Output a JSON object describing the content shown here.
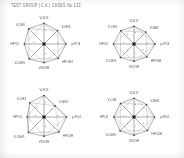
{
  "document": {
    "kind": "scanned-figure-sheet",
    "caption": "TEST GROUP (C.A.) CASES  No  133",
    "background_color": "#fdfdfc",
    "ink_color": "#3b3b3b"
  },
  "chart_data": [
    {
      "id": "panel-top-left",
      "type": "radar",
      "title": "",
      "grid": true,
      "legend_position": "none",
      "categories": [
        "V-SO2",
        "V-NH2",
        "p-PO4",
        "HPO4H",
        "VSO3H",
        "V-C6H5",
        "HPO4",
        "V-CH3"
      ],
      "angles_deg": [
        90,
        45,
        0,
        -45,
        -90,
        -135,
        180,
        135
      ],
      "rlim": [
        0,
        1
      ],
      "series": [
        {
          "name": "case-133-a",
          "values": [
            0.86,
            0.8,
            0.92,
            0.84,
            0.78,
            0.88,
            0.82,
            0.9
          ]
        }
      ],
      "edge_labels": [
        "4",
        "3",
        "6",
        "2",
        "5",
        "2",
        "3",
        "4"
      ]
    },
    {
      "id": "panel-top-right",
      "type": "radar",
      "title": "",
      "grid": true,
      "legend_position": "none",
      "categories": [
        "V-SO2",
        "V-NH2",
        "p-PO4",
        "HPO4H",
        "VSO3H",
        "V-C6H5",
        "HPO4",
        "V-CH3"
      ],
      "angles_deg": [
        90,
        45,
        0,
        -45,
        -90,
        -135,
        180,
        135
      ],
      "rlim": [
        0,
        1
      ],
      "series": [
        {
          "name": "case-133-b",
          "values": [
            0.74,
            0.7,
            0.88,
            0.76,
            0.72,
            0.8,
            0.86,
            0.78
          ]
        }
      ],
      "edge_labels": [
        "3",
        "4",
        "5",
        "3",
        "4",
        "2",
        "6",
        "3"
      ]
    },
    {
      "id": "panel-bottom-left",
      "type": "radar",
      "title": "",
      "grid": true,
      "legend_position": "none",
      "categories": [
        "V-SO2",
        "V-NH2",
        "p-PO4",
        "HPO4H",
        "VSO3H",
        "V-C6H5",
        "HPO4",
        "V-CH3"
      ],
      "angles_deg": [
        90,
        45,
        0,
        -45,
        -90,
        -135,
        180,
        135
      ],
      "rlim": [
        0,
        1
      ],
      "series": [
        {
          "name": "case-133-c",
          "values": [
            0.9,
            0.66,
            0.94,
            0.88,
            0.8,
            0.92,
            0.7,
            0.84
          ]
        }
      ],
      "edge_labels": [
        "5",
        "2",
        "6",
        "4",
        "3",
        "4",
        "2",
        "5"
      ]
    },
    {
      "id": "panel-bottom-right",
      "type": "radar",
      "title": "",
      "grid": true,
      "legend_position": "none",
      "categories": [
        "V-SO2",
        "V-NH2",
        "p-PO4",
        "HPO4H",
        "VSO3H",
        "V-C6H5",
        "HPO4",
        "V-CH3"
      ],
      "angles_deg": [
        90,
        45,
        0,
        -45,
        -90,
        -135,
        180,
        135
      ],
      "rlim": [
        0,
        1
      ],
      "series": [
        {
          "name": "case-133-d",
          "values": [
            0.78,
            0.74,
            0.86,
            0.8,
            0.76,
            0.82,
            0.84,
            0.8
          ]
        }
      ],
      "edge_labels": [
        "3",
        "3",
        "5",
        "3",
        "4",
        "3",
        "5",
        "4"
      ]
    }
  ]
}
